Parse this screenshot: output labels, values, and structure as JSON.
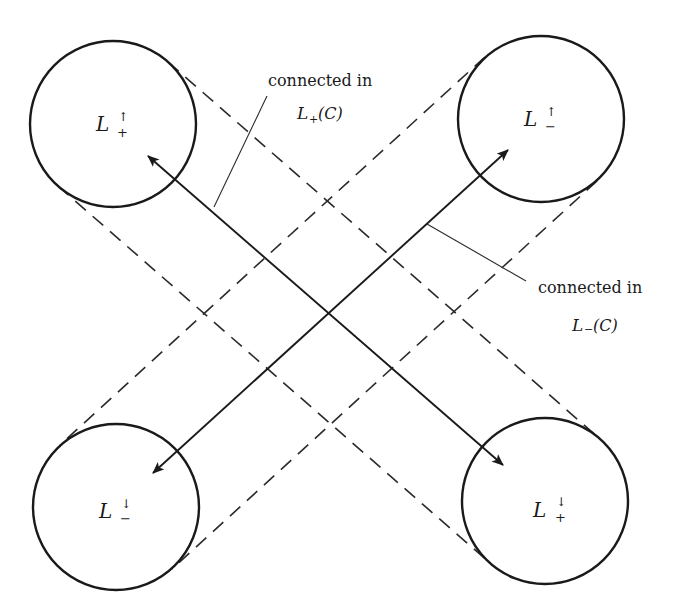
{
  "diagram": {
    "type": "set-connectivity-diagram",
    "nodes": [
      {
        "id": "tl",
        "base": "L",
        "sup": "↑",
        "sub": "+",
        "cx": 113,
        "cy": 124,
        "r": 83
      },
      {
        "id": "tr",
        "base": "L",
        "sup": "↑",
        "sub": "−",
        "cx": 541,
        "cy": 119,
        "r": 83
      },
      {
        "id": "bl",
        "base": "L",
        "sup": "↓",
        "sub": "−",
        "cx": 116,
        "cy": 507,
        "r": 83
      },
      {
        "id": "br",
        "base": "L",
        "sup": "↓",
        "sub": "+",
        "cx": 545,
        "cy": 501,
        "r": 83
      }
    ],
    "arrows": [
      {
        "from": "br",
        "to": "tl",
        "style": "double-headed",
        "endpoints": [
          [
            148,
            156
          ],
          [
            503,
            465
          ]
        ]
      },
      {
        "from": "bl",
        "to": "tr",
        "style": "double-headed",
        "endpoints": [
          [
            153,
            473
          ],
          [
            508,
            150
          ]
        ]
      }
    ],
    "dashed_connections": [
      {
        "between": [
          "tl",
          "br"
        ],
        "label_ref": "plus"
      },
      {
        "between": [
          "tr",
          "bl"
        ],
        "label_ref": "minus"
      }
    ],
    "annotations": {
      "plus": {
        "line1": "connected in",
        "base": "L",
        "sub": "+",
        "arg": "(C)"
      },
      "minus": {
        "line1": "connected in",
        "base": "L",
        "sub": "−",
        "arg": "(C)"
      }
    },
    "colors": {
      "ink": "#1a1a1a",
      "background": "#ffffff"
    }
  }
}
